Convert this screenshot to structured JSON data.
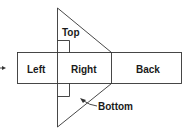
{
  "diagram": {
    "type": "net-of-triangular-prism",
    "labels": {
      "top": "Top",
      "left": "Left",
      "right": "Right",
      "back": "Back",
      "bottom": "Bottom"
    },
    "colors": {
      "stroke": "#333333",
      "text": "#1a1a1a",
      "background": "#ffffff"
    }
  }
}
